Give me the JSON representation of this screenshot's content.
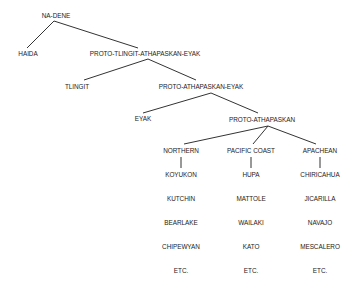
{
  "diagram": {
    "type": "tree",
    "line_color": "#333333",
    "text_color": "#222222",
    "nodes": {
      "na_dene": "NA-DENE",
      "haida": "HAIDA",
      "proto_tlingit_athapaskan_eyak": "PROTO-TLINGIT-ATHAPASKAN-EYAK",
      "tlingit": "TLINGIT",
      "proto_athapaskan_eyak": "PROTO-ATHAPASKAN-EYAK",
      "eyak": "EYAK",
      "proto_athapaskan": "PROTO-ATHAPASKAN"
    },
    "groups": [
      {
        "label": "NORTHERN",
        "languages": [
          "KOYUKON",
          "KUTCHIN",
          "BEARLAKE",
          "CHIPEWYAN",
          "ETC."
        ]
      },
      {
        "label": "PACIFIC COAST",
        "languages": [
          "HUPA",
          "MATTOLE",
          "WAILAKI",
          "KATO",
          "ETC."
        ]
      },
      {
        "label": "APACHEAN",
        "languages": [
          "CHIRICAHUA",
          "JICARILLA",
          "NAVAJO",
          "MESCALERO",
          "ETC."
        ]
      }
    ]
  }
}
